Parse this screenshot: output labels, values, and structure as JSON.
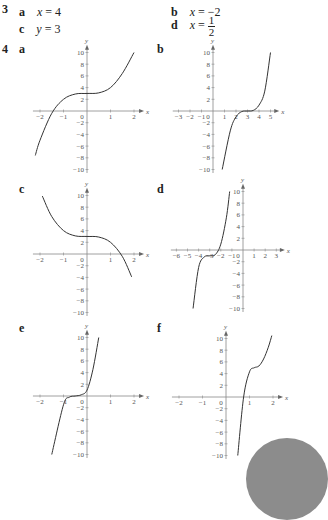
{
  "q3": {
    "number": "3",
    "answers": [
      {
        "label": "a",
        "var": "x",
        "eq": " = ",
        "value": "4"
      },
      {
        "label": "b",
        "var": "x",
        "eq": " = ",
        "value": "−2"
      },
      {
        "label": "c",
        "var": "y",
        "eq": " = ",
        "value": "3"
      },
      {
        "label": "d",
        "var": "x",
        "eq": " = ",
        "num": "1",
        "den": "2"
      }
    ]
  },
  "q4": {
    "number": "4",
    "labels": [
      "a",
      "b",
      "c",
      "d",
      "e",
      "f"
    ]
  },
  "chart_data": [
    {
      "id": "a",
      "type": "line",
      "xlabel": "x",
      "ylabel": "y",
      "xticks": [
        -2,
        -1,
        0,
        1,
        2
      ],
      "yticks": [
        -10,
        -8,
        -6,
        -4,
        -2,
        2,
        4,
        6,
        8,
        10
      ],
      "xlim": [
        -2.3,
        2.3
      ],
      "ylim": [
        -10,
        10
      ],
      "description": "y = (x)^3 + 3, inflection at (0,3)",
      "x": [
        -2.2,
        -2,
        -1.5,
        -1,
        -0.5,
        0,
        0.5,
        1,
        1.5,
        2
      ],
      "y": [
        -7.6,
        -5,
        -0.4,
        2,
        2.9,
        3,
        3.1,
        4,
        6.4,
        10
      ]
    },
    {
      "id": "b",
      "type": "line",
      "xlabel": "x",
      "ylabel": "y",
      "xticks": [
        -3,
        -2,
        -1,
        0,
        1,
        2,
        3,
        4,
        5
      ],
      "yticks": [
        -10,
        -8,
        -6,
        -4,
        -2,
        2,
        4,
        6,
        8,
        10
      ],
      "xlim": [
        -3.5,
        5.5
      ],
      "ylim": [
        -10,
        10
      ],
      "description": "stationary inflection at (3,0)",
      "x": [
        0.8,
        1.5,
        2,
        2.5,
        3,
        3.5,
        4,
        4.5,
        5
      ],
      "y": [
        -10,
        -3.4,
        -1,
        -0.1,
        0,
        0.1,
        1,
        3.4,
        10
      ]
    },
    {
      "id": "c",
      "type": "line",
      "xlabel": "x",
      "ylabel": "y",
      "xticks": [
        -2,
        -1,
        0,
        1,
        2
      ],
      "yticks": [
        -10,
        -8,
        -6,
        -4,
        -2,
        2,
        4,
        6,
        8,
        10
      ],
      "xlim": [
        -2.3,
        2.3
      ],
      "ylim": [
        -10,
        10
      ],
      "description": "y = 3 − x^3, inflection at (0,3)",
      "x": [
        -1.9,
        -1.5,
        -1,
        -0.5,
        0,
        0.5,
        1,
        1.5,
        1.9
      ],
      "y": [
        9.9,
        6.4,
        4,
        3.1,
        3,
        2.9,
        2,
        -0.4,
        -3.9
      ]
    },
    {
      "id": "d",
      "type": "line",
      "xlabel": "x",
      "ylabel": "y",
      "xticks": [
        -6,
        -5,
        -4,
        -3,
        -2,
        -1,
        0,
        1,
        2,
        3
      ],
      "yticks": [
        -10,
        -8,
        -6,
        -4,
        -2,
        2,
        4,
        6,
        8,
        10
      ],
      "xlim": [
        -6.5,
        3.5
      ],
      "ylim": [
        -10,
        10
      ],
      "description": "inflection near (-3,-1)",
      "x": [
        -4.5,
        -4,
        -3.5,
        -3,
        -2.5,
        -2,
        -1.5,
        -1.2
      ],
      "y": [
        -10,
        -3,
        -1.2,
        -1,
        -0.8,
        1,
        5.5,
        10
      ]
    },
    {
      "id": "e",
      "type": "line",
      "xlabel": "x",
      "ylabel": "y",
      "xticks": [
        -2,
        -1,
        0,
        1,
        2
      ],
      "yticks": [
        -10,
        -8,
        -6,
        -4,
        -2,
        2,
        4,
        6,
        8,
        10
      ],
      "xlim": [
        -2.3,
        2.3
      ],
      "ylim": [
        -10,
        10
      ],
      "description": "stationary inflection near (-0.5,0)",
      "x": [
        -1.5,
        -1,
        -0.75,
        -0.5,
        -0.25,
        0,
        0.25,
        0.5
      ],
      "y": [
        -10,
        -1.5,
        -0.2,
        0,
        0.2,
        1,
        4.5,
        10
      ]
    },
    {
      "id": "f",
      "type": "line",
      "xlabel": "x",
      "ylabel": "y",
      "xticks": [
        -2,
        -1,
        0,
        1,
        2
      ],
      "yticks": [
        -10,
        -8,
        -6,
        -4,
        -2,
        2,
        4,
        6,
        8,
        10
      ],
      "xlim": [
        -2.3,
        2.3
      ],
      "ylim": [
        -10,
        10
      ],
      "description": "stationary inflection near (1.2,5)",
      "x": [
        0.5,
        0.75,
        1,
        1.2,
        1.4,
        1.6,
        1.8,
        1.95
      ],
      "y": [
        -10,
        0,
        4.3,
        5,
        5.3,
        6.5,
        8.5,
        10.5
      ]
    }
  ]
}
